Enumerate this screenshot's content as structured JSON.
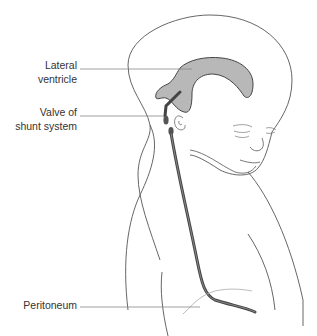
{
  "figure": {
    "labels": [
      {
        "id": "lateral-ventricle",
        "text": "Lateral\nventricle"
      },
      {
        "id": "valve-of-shunt-system",
        "text": "Valve of\nshunt system"
      },
      {
        "id": "peritoneum",
        "text": "Peritoneum"
      }
    ]
  },
  "colors": {
    "outline": "#555555",
    "ventricle_fill": "#b8b8b8",
    "ventricle_stroke": "#444444",
    "shunt_tube": "#444444",
    "leader_line": "#888888",
    "label_text": "#333333"
  }
}
